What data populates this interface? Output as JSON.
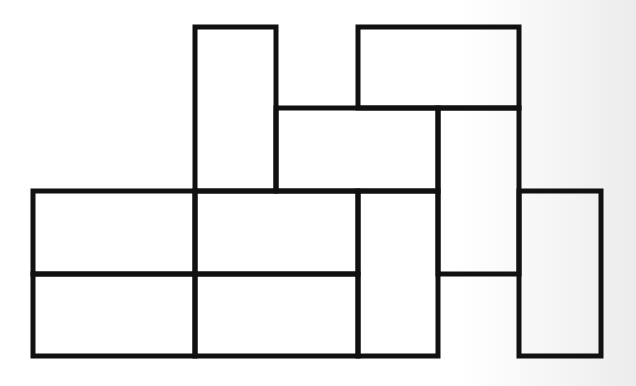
{
  "diagram": {
    "type": "rectangle-tiling",
    "stroke_color": "#111111",
    "stroke_width": 5,
    "fill_color": "#ffffff",
    "background_color": "#ffffff",
    "unit": 81.5,
    "rectangles": [
      {
        "id": "r1",
        "x": 195,
        "y": 27,
        "w": 81,
        "h": 164,
        "orientation": "vertical"
      },
      {
        "id": "r2",
        "x": 358,
        "y": 27,
        "w": 161,
        "h": 81,
        "orientation": "horizontal"
      },
      {
        "id": "r3",
        "x": 276,
        "y": 108,
        "w": 162,
        "h": 83,
        "orientation": "horizontal"
      },
      {
        "id": "r4",
        "x": 438,
        "y": 108,
        "w": 81,
        "h": 166,
        "orientation": "vertical"
      },
      {
        "id": "r5",
        "x": 33,
        "y": 191,
        "w": 162,
        "h": 83,
        "orientation": "horizontal"
      },
      {
        "id": "r6",
        "x": 195,
        "y": 191,
        "w": 163,
        "h": 83,
        "orientation": "horizontal"
      },
      {
        "id": "r7",
        "x": 33,
        "y": 274,
        "w": 162,
        "h": 82,
        "orientation": "horizontal"
      },
      {
        "id": "r8",
        "x": 195,
        "y": 274,
        "w": 163,
        "h": 82,
        "orientation": "horizontal"
      },
      {
        "id": "r9",
        "x": 358,
        "y": 191,
        "w": 80,
        "h": 165,
        "orientation": "vertical"
      },
      {
        "id": "r10",
        "x": 519,
        "y": 191,
        "w": 82,
        "h": 165,
        "orientation": "vertical"
      }
    ]
  }
}
